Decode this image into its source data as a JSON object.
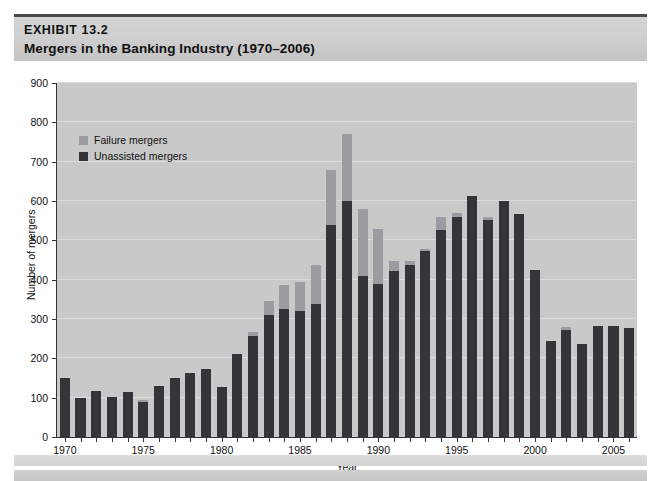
{
  "exhibit": {
    "number": "EXHIBIT 13.2",
    "title": "Mergers in the Banking Industry (1970–2006)"
  },
  "colors": {
    "unassisted": "#353539",
    "failure": "#9b9ba1",
    "plot_background": "#c9c9c9",
    "header_band": "#cfcfcf",
    "gridline": "#dcdcdc",
    "axis": "#333333"
  },
  "chart_data": {
    "type": "bar",
    "stacked": true,
    "title": "Mergers in the Banking Industry (1970–2006)",
    "xlabel": "Year",
    "ylabel": "Number of mergers",
    "ylim": [
      0,
      900
    ],
    "ytick_step": 100,
    "yticks": [
      0,
      100,
      200,
      300,
      400,
      500,
      600,
      700,
      800,
      900
    ],
    "xticks": [
      1970,
      1975,
      1980,
      1985,
      1990,
      1995,
      2000,
      2005
    ],
    "grid": true,
    "legend_position": "upper-left-inside",
    "categories": [
      1970,
      1971,
      1972,
      1973,
      1974,
      1975,
      1976,
      1977,
      1978,
      1979,
      1980,
      1981,
      1982,
      1983,
      1984,
      1985,
      1986,
      1987,
      1988,
      1989,
      1990,
      1991,
      1992,
      1993,
      1994,
      1995,
      1996,
      1997,
      1998,
      1999,
      2000,
      2001,
      2002,
      2003,
      2004,
      2005,
      2006
    ],
    "series": [
      {
        "name": "Unassisted mergers",
        "color": "#353539",
        "values": [
          150,
          98,
          118,
          103,
          115,
          90,
          130,
          150,
          163,
          172,
          127,
          210,
          258,
          311,
          325,
          321,
          338,
          539,
          600,
          410,
          390,
          422,
          437,
          473,
          527,
          560,
          612,
          553,
          600,
          568,
          424,
          245,
          272,
          236,
          281,
          281,
          277
        ]
      },
      {
        "name": "Failure mergers",
        "color": "#9b9ba1",
        "values": [
          0,
          0,
          0,
          0,
          0,
          4,
          0,
          0,
          0,
          0,
          0,
          0,
          8,
          34,
          61,
          74,
          100,
          140,
          170,
          170,
          140,
          25,
          10,
          5,
          32,
          10,
          0,
          6,
          0,
          0,
          0,
          0,
          8,
          0,
          0,
          0,
          0
        ]
      }
    ],
    "totals": [
      150,
      98,
      118,
      103,
      115,
      94,
      130,
      150,
      163,
      172,
      127,
      210,
      266,
      345,
      386,
      395,
      438,
      679,
      770,
      580,
      530,
      447,
      447,
      478,
      559,
      570,
      612,
      559,
      600,
      568,
      424,
      245,
      280,
      236,
      281,
      281,
      277
    ]
  },
  "legend": {
    "items": [
      {
        "label": "Failure mergers",
        "color": "#9b9ba1"
      },
      {
        "label": "Unassisted mergers",
        "color": "#353539"
      }
    ]
  }
}
